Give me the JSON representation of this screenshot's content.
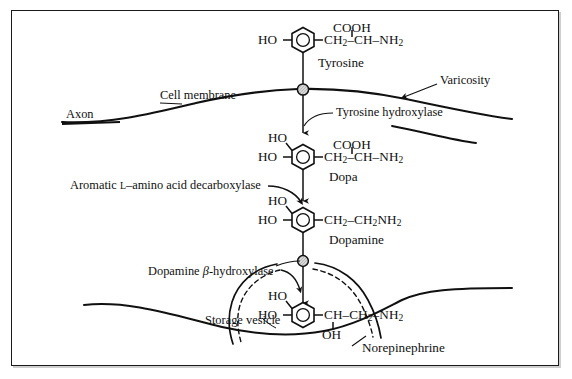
{
  "figure": {
    "type": "biochemical-pathway-diagram",
    "border_color": "#1a1a1a",
    "line_color": "#101010",
    "background": "#ffffff"
  },
  "anatomy": {
    "axon_label": "Axon",
    "cell_membrane_label": "Cell membrane",
    "varicosity_label": "Varicosity",
    "storage_vesicle_label": "Storage vesicle"
  },
  "enzymes": {
    "tyrosine_hydroxylase": "Tyrosine hydroxylase",
    "aromatic_decarboxylase_pre": "Aromatic ",
    "aromatic_decarboxylase_smallcap": "L",
    "aromatic_decarboxylase_post": "–amino acid decarboxylase",
    "dopamine_hydroxylase_pre": "Dopamine ",
    "dopamine_hydroxylase_beta": "β",
    "dopamine_hydroxylase_post": "-hydroxylase"
  },
  "molecules": [
    {
      "id": "tyrosine",
      "name": "Tyrosine",
      "ring_substituent_left": "HO",
      "ring_substituent_upper_left": "",
      "top_group": "COOH",
      "side_chain_pre": "CH",
      "side_chain_pre_sub": "2",
      "side_chain_mid": "–CH–NH",
      "side_chain_end_sub": "2",
      "bottom_group": ""
    },
    {
      "id": "dopa",
      "name": "Dopa",
      "ring_substituent_left": "HO",
      "ring_substituent_upper_left": "HO",
      "top_group": "COOH",
      "side_chain_pre": "CH",
      "side_chain_pre_sub": "2",
      "side_chain_mid": "–CH–NH",
      "side_chain_end_sub": "2",
      "bottom_group": ""
    },
    {
      "id": "dopamine",
      "name": "Dopamine",
      "ring_substituent_left": "HO",
      "ring_substituent_upper_left": "HO",
      "top_group": "",
      "side_chain_pre": "CH",
      "side_chain_pre_sub": "2",
      "side_chain_mid": "–CH",
      "side_chain_mid_sub": "2",
      "side_chain_tail": "NH",
      "side_chain_end_sub": "2",
      "bottom_group": ""
    },
    {
      "id": "norepinephrine",
      "name": "Norepinephrine",
      "ring_substituent_left": "HO",
      "ring_substituent_upper_left": "HO",
      "top_group": "",
      "side_chain_pre": "CH–CH",
      "side_chain_pre_sub": "2",
      "side_chain_mid": "–NH",
      "side_chain_end_sub": "2",
      "bottom_group": "OH"
    }
  ],
  "steps": [
    {
      "from": "Tyrosine",
      "to": "Dopa",
      "enzyme": "Tyrosine hydroxylase"
    },
    {
      "from": "Dopa",
      "to": "Dopamine",
      "enzyme": "Aromatic L–amino acid decarboxylase"
    },
    {
      "from": "Dopamine",
      "to": "Norepinephrine",
      "enzyme": "Dopamine β-hydroxylase"
    }
  ]
}
